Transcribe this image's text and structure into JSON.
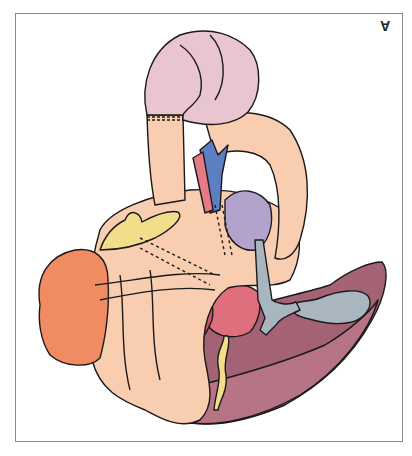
{
  "figure": {
    "panel_label": "A",
    "type": "anatomical illustration",
    "colors": {
      "pink_bowel": "#e8c5cf",
      "peach_tissue": "#f8cdb0",
      "blue_vessel": "#5b7fc0",
      "red_vessel": "#e67a86",
      "purple_tissue": "#b3a3cc",
      "yellow_fat": "#f2de8a",
      "orange_organ": "#f08b62",
      "liver_dark": "#9a5a6e",
      "liver_light": "#b4707f",
      "gray_duct": "#a9b6bf",
      "red_mass": "#e06f7d"
    }
  }
}
